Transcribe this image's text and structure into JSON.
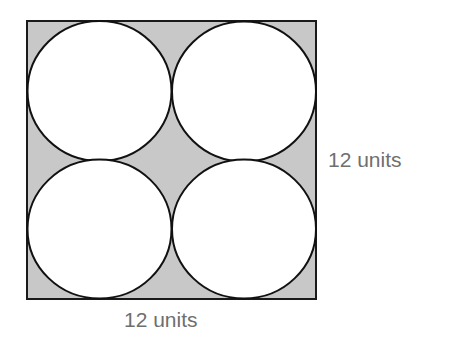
{
  "diagram": {
    "square": {
      "side_label": "12 units",
      "fill": "#c8c8c8",
      "stroke": "#1a1a1a"
    },
    "circles": {
      "count": 4,
      "fill": "#ffffff",
      "stroke": "#111111"
    },
    "labels": {
      "right": "12 units",
      "bottom": "12 units"
    },
    "colors": {
      "shaded": "#c8c8c8",
      "outline": "#111111",
      "label_text": "#6f6f6f"
    }
  }
}
